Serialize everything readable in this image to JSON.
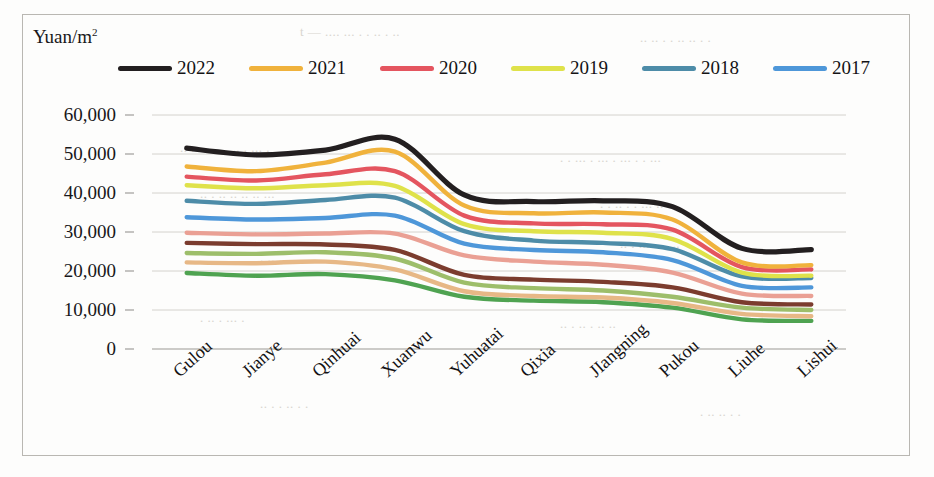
{
  "figure": {
    "axis_title": "Yuan/m",
    "axis_title_sup": "2",
    "frame": true
  },
  "ghost_text": [
    {
      "t": "t — ....  ...  .  . ..  .   ..",
      "x": 300,
      "y": 24
    },
    {
      "t": ".. ..  . . ..  .. . .",
      "x": 640,
      "y": 30
    },
    {
      "t": "..  . ..  . . . .. . ...  .",
      "x": 180,
      "y": 140
    },
    {
      "t": ". . ... . ...  .  ...  . . ...",
      "x": 560,
      "y": 150
    },
    {
      "t": ".. .  .. .. ..  .. ...",
      "x": 200,
      "y": 186
    },
    {
      "t": ". .  ..  .  . ... ..",
      "x": 600,
      "y": 196
    },
    {
      "t": ".  .. . .. . ..",
      "x": 260,
      "y": 250
    },
    {
      "t": ".. . ...  . .. ..",
      "x": 620,
      "y": 236
    },
    {
      "t": ". .. . ... .",
      "x": 200,
      "y": 310
    },
    {
      "t": ".. .  .. . ..  ..",
      "x": 560,
      "y": 316
    },
    {
      "t": "..  . . .. . .",
      "x": 260,
      "y": 396
    },
    {
      "t": ". .. ..  . .",
      "x": 700,
      "y": 404
    }
  ],
  "chart_data": {
    "type": "line",
    "title": "Yuan/m2",
    "xlabel": "",
    "ylabel": "Yuan/m2",
    "ylim": [
      0,
      60000
    ],
    "ytick_labels": [
      "60,000",
      "50,000",
      "40,000",
      "30,000",
      "20,000",
      "10,000",
      "0"
    ],
    "ytick_values": [
      60000,
      50000,
      40000,
      30000,
      20000,
      10000,
      0
    ],
    "grid": true,
    "legend_position": "top",
    "categories": [
      "Gulou",
      "Jianye",
      "Qinhuai",
      "Xuanwu",
      "Yuhuatai",
      "Qixia",
      "JIangning",
      "Pukou",
      "Liuhe",
      "Lishui"
    ],
    "series": [
      {
        "name": "2022",
        "color": "#231f20",
        "in_legend": true,
        "values": [
          51500,
          49800,
          51000,
          53800,
          39500,
          37800,
          38000,
          36500,
          25800,
          25500
        ]
      },
      {
        "name": "2021",
        "color": "#f0b23c",
        "in_legend": true,
        "values": [
          46800,
          45600,
          47800,
          50600,
          36800,
          34800,
          35000,
          33200,
          22200,
          21500
        ]
      },
      {
        "name": "2020",
        "color": "#e4555f",
        "in_legend": true,
        "values": [
          44200,
          43200,
          44800,
          45600,
          34200,
          32200,
          32000,
          30600,
          21000,
          20400
        ]
      },
      {
        "name": "2019",
        "color": "#dfe24a",
        "in_legend": true,
        "values": [
          42000,
          41200,
          42000,
          41800,
          32000,
          30200,
          29800,
          28200,
          19600,
          18800
        ]
      },
      {
        "name": "2018",
        "color": "#4d8ca8",
        "in_legend": true,
        "values": [
          38000,
          37200,
          38200,
          38800,
          30200,
          27800,
          27200,
          25600,
          18600,
          18200
        ]
      },
      {
        "name": "2017",
        "color": "#4e97d9",
        "in_legend": true,
        "values": [
          33800,
          33200,
          33600,
          34200,
          27000,
          25400,
          24800,
          22800,
          16200,
          15800
        ]
      },
      {
        "name": "series-7",
        "color": "#eaa094",
        "in_legend": false,
        "values": [
          29800,
          29400,
          29600,
          29600,
          24000,
          22400,
          21600,
          19600,
          14200,
          13600
        ]
      },
      {
        "name": "series-8",
        "color": "#7b3c2e",
        "in_legend": false,
        "values": [
          27200,
          26900,
          26800,
          25400,
          19000,
          17800,
          17200,
          15800,
          12000,
          11400
        ]
      },
      {
        "name": "series-9",
        "color": "#9dbe6a",
        "in_legend": false,
        "values": [
          24600,
          24400,
          24800,
          23200,
          17000,
          15600,
          15000,
          13400,
          10600,
          10000
        ]
      },
      {
        "name": "series-10",
        "color": "#e7b886",
        "in_legend": false,
        "values": [
          22200,
          22000,
          22400,
          20400,
          14800,
          13600,
          13200,
          11800,
          9000,
          8400
        ]
      },
      {
        "name": "series-11",
        "color": "#4fa351",
        "in_legend": false,
        "values": [
          19500,
          18800,
          19200,
          17600,
          13400,
          12400,
          12000,
          10600,
          7600,
          7200
        ]
      }
    ]
  }
}
